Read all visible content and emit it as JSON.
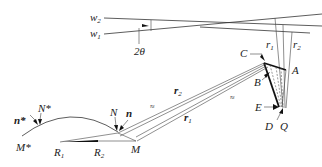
{
  "diagram": {
    "labels": {
      "w2": {
        "main": "w",
        "sub": "2"
      },
      "w1": {
        "main": "w",
        "sub": "1"
      },
      "angle": "2θ",
      "r1_top": {
        "main": "r",
        "sub": "1"
      },
      "r2_top": {
        "main": "r",
        "sub": "2"
      },
      "C": "C",
      "A": "A",
      "B": "B",
      "E": "E",
      "D": "D",
      "Q": "Q",
      "r2_mid": {
        "main": "r",
        "sub": "2"
      },
      "r1_mid": {
        "main": "r",
        "sub": "1"
      },
      "approx1": "≈",
      "approx2": "≈",
      "N": "N",
      "n": "n",
      "N_star": "N*",
      "n_star": "n*",
      "M_star": "M*",
      "M": "M",
      "R1": {
        "main": "R",
        "sub": "1"
      },
      "R2": {
        "main": "R",
        "sub": "2"
      }
    }
  }
}
